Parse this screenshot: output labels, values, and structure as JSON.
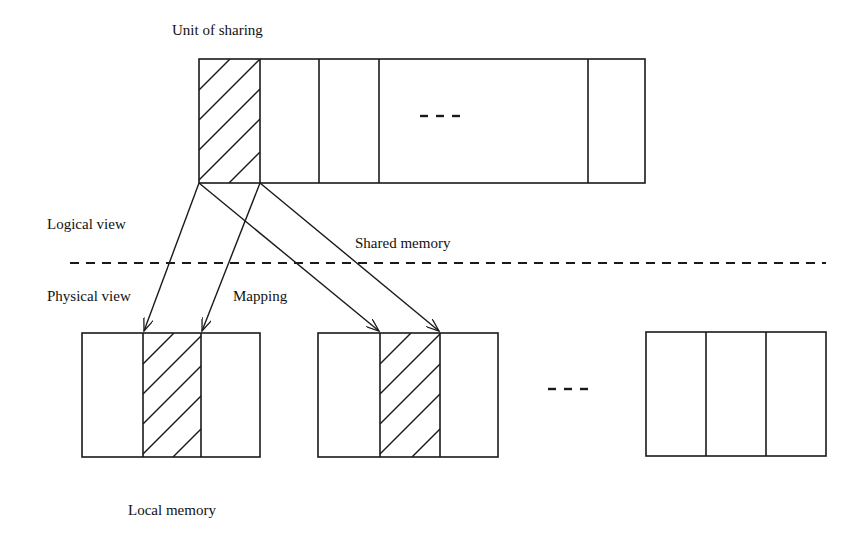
{
  "labels": {
    "unit_of_sharing": "Unit of sharing",
    "logical_view": "Logical view",
    "shared_memory": "Shared memory",
    "physical_view": "Physical view",
    "mapping": "Mapping",
    "local_memory": "Local memory",
    "ellipsis_top": "- - -",
    "ellipsis_bottom": "- - -"
  },
  "colors": {
    "stroke": "#1a1a1a",
    "background": "#ffffff"
  }
}
